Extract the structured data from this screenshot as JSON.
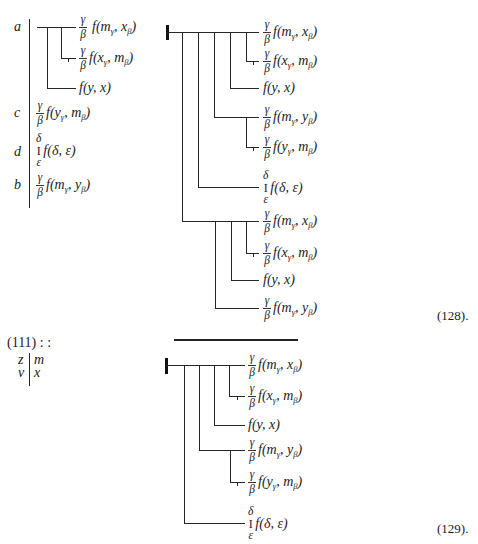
{
  "syntax": {
    "open": "(",
    "sep": ", ",
    "close": ")"
  },
  "left_block": {
    "row_labels": {
      "a": "a",
      "c": "c",
      "d": "d",
      "b": "b"
    },
    "a_tree": [
      {
        "top": "γ",
        "bot": "β",
        "fn": "f",
        "a1": "m",
        "s1": "γ",
        "a2": "x",
        "s2": "β"
      },
      {
        "top": "γ",
        "bot": "β",
        "fn": "f",
        "a1": "x",
        "s1": "γ",
        "a2": "m",
        "s2": "β"
      },
      {
        "fn": "f",
        "a1": "y",
        "a2": "x"
      }
    ],
    "c": {
      "top": "γ",
      "bot": "β",
      "fn": "f",
      "a1": "y",
      "s1": "γ",
      "a2": "m",
      "s2": "β"
    },
    "d": {
      "top": "δ",
      "mid": "I",
      "bot": "ε",
      "fn": "f",
      "a1": "δ",
      "a2": "ε"
    },
    "b": {
      "top": "γ",
      "bot": "β",
      "fn": "f",
      "a1": "m",
      "s1": "γ",
      "a2": "y",
      "s2": "β"
    }
  },
  "formula_128": {
    "number": "(128).",
    "rows": [
      {
        "top": "γ",
        "bot": "β",
        "fn": "f",
        "a1": "m",
        "s1": "γ",
        "a2": "x",
        "s2": "β"
      },
      {
        "top": "γ",
        "bot": "β",
        "fn": "f",
        "a1": "x",
        "s1": "γ",
        "a2": "m",
        "s2": "β"
      },
      {
        "fn": "f",
        "a1": "y",
        "a2": "x"
      },
      {
        "top": "γ",
        "bot": "β",
        "fn": "f",
        "a1": "m",
        "s1": "γ",
        "a2": "y",
        "s2": "β"
      },
      {
        "top": "γ",
        "bot": "β",
        "fn": "f",
        "a1": "y",
        "s1": "γ",
        "a2": "m",
        "s2": "β"
      },
      {
        "top": "δ",
        "mid": "I",
        "bot": "ε",
        "fn": "f",
        "a1": "δ",
        "a2": "ε"
      },
      {
        "top": "γ",
        "bot": "β",
        "fn": "f",
        "a1": "m",
        "s1": "γ",
        "a2": "x",
        "s2": "β"
      },
      {
        "top": "γ",
        "bot": "β",
        "fn": "f",
        "a1": "x",
        "s1": "γ",
        "a2": "m",
        "s2": "β"
      },
      {
        "fn": "f",
        "a1": "y",
        "a2": "x"
      },
      {
        "top": "γ",
        "bot": "β",
        "fn": "f",
        "a1": "m",
        "s1": "γ",
        "a2": "y",
        "s2": "β"
      }
    ]
  },
  "reference": {
    "label": "(111) : :",
    "left": [
      "z",
      "v"
    ],
    "right": [
      "m",
      "x"
    ]
  },
  "formula_129": {
    "number": "(129).",
    "rows": [
      {
        "top": "γ",
        "bot": "β",
        "fn": "f",
        "a1": "m",
        "s1": "γ",
        "a2": "x",
        "s2": "β"
      },
      {
        "top": "γ",
        "bot": "β",
        "fn": "f",
        "a1": "x",
        "s1": "γ",
        "a2": "m",
        "s2": "β"
      },
      {
        "fn": "f",
        "a1": "y",
        "a2": "x"
      },
      {
        "top": "γ",
        "bot": "β",
        "fn": "f",
        "a1": "m",
        "s1": "γ",
        "a2": "y",
        "s2": "β"
      },
      {
        "top": "γ",
        "bot": "β",
        "fn": "f",
        "a1": "y",
        "s1": "γ",
        "a2": "m",
        "s2": "β"
      },
      {
        "top": "δ",
        "mid": "I",
        "bot": "ε",
        "fn": "f",
        "a1": "δ",
        "a2": "ε"
      }
    ]
  }
}
